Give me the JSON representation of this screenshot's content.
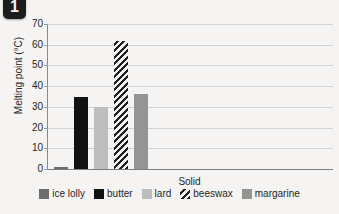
{
  "badge": {
    "label": "1"
  },
  "chart_data": {
    "type": "bar",
    "title": "",
    "xlabel": "Solid",
    "ylabel": "Melting point (°C)",
    "categories": [
      "Solid"
    ],
    "ylim": [
      0,
      70
    ],
    "ytick_step": 10,
    "yticks": [
      "70",
      "60",
      "50",
      "40",
      "30",
      "20",
      "10",
      "0"
    ],
    "grid": true,
    "legend_position": "bottom",
    "series": [
      {
        "name": "ice lolly",
        "values": [
          1
        ],
        "color": "#6d6d6d",
        "pattern": "solid"
      },
      {
        "name": "butter",
        "values": [
          35
        ],
        "color": "#121212",
        "pattern": "solid"
      },
      {
        "name": "lard",
        "values": [
          30
        ],
        "color": "#bdbdbd",
        "pattern": "solid"
      },
      {
        "name": "beeswax",
        "values": [
          62
        ],
        "color": "#1f1f1f",
        "pattern": "diagonal-hatch"
      },
      {
        "name": "margarine",
        "values": [
          36
        ],
        "color": "#949494",
        "pattern": "solid"
      }
    ]
  }
}
